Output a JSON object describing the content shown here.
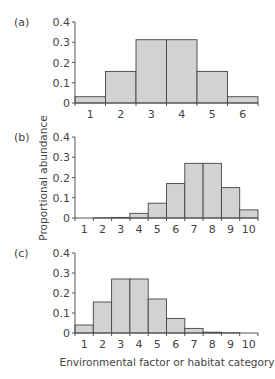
{
  "chart_data": [
    {
      "type": "bar",
      "panel": "(a)",
      "categories": [
        "1",
        "2",
        "3",
        "4",
        "5",
        "6"
      ],
      "values": [
        0.031,
        0.156,
        0.3125,
        0.3125,
        0.156,
        0.031
      ],
      "ylim": [
        0,
        0.4
      ],
      "yticks": [
        "0",
        "0.1",
        "0.2",
        "0.3",
        "0.4"
      ],
      "grid": false
    },
    {
      "type": "bar",
      "panel": "(b)",
      "categories": [
        "1",
        "2",
        "3",
        "4",
        "5",
        "6",
        "7",
        "8",
        "9",
        "10"
      ],
      "values": [
        0.0,
        0.001,
        0.003,
        0.023,
        0.073,
        0.17,
        0.27,
        0.27,
        0.15,
        0.04
      ],
      "ylim": [
        0,
        0.4
      ],
      "yticks": [
        "0",
        "0.1",
        "0.2",
        "0.3",
        "0.4"
      ],
      "grid": false
    },
    {
      "type": "bar",
      "panel": "(c)",
      "categories": [
        "1",
        "2",
        "3",
        "4",
        "5",
        "6",
        "7",
        "8",
        "9",
        "10"
      ],
      "values": [
        0.04,
        0.155,
        0.27,
        0.27,
        0.17,
        0.073,
        0.023,
        0.004,
        0.001,
        0.0
      ],
      "ylim": [
        0,
        0.4
      ],
      "yticks": [
        "0",
        "0.1",
        "0.2",
        "0.3",
        "0.4"
      ],
      "grid": false
    }
  ],
  "ylabel": "Proportional abundance",
  "xlabel": "Environmental factor or habitat category",
  "colors": {
    "bar_fill": "#d2d2d2",
    "bar_stroke": "#444444",
    "axis": "#555555"
  }
}
